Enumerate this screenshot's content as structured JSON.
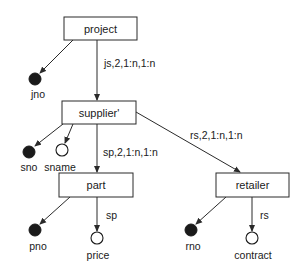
{
  "diagram": {
    "type": "object-hierarchy-schema",
    "nodes": [
      {
        "id": "project",
        "label": "project"
      },
      {
        "id": "supplier",
        "label": "supplier'"
      },
      {
        "id": "part",
        "label": "part"
      },
      {
        "id": "retailer",
        "label": "retailer"
      }
    ],
    "relationships": [
      {
        "from": "project",
        "to": "supplier",
        "label": "js,2,1:n,1:n"
      },
      {
        "from": "supplier",
        "to": "part",
        "label": "sp,2,1:n,1:n"
      },
      {
        "from": "supplier",
        "to": "retailer",
        "label": "rs,2,1:n,1:n"
      }
    ],
    "attributes": [
      {
        "owner": "project",
        "label": "jno",
        "key": true,
        "edge_label": ""
      },
      {
        "owner": "supplier",
        "label": "sno",
        "key": true,
        "edge_label": ""
      },
      {
        "owner": "supplier",
        "label": "sname",
        "key": false,
        "edge_label": ""
      },
      {
        "owner": "part",
        "label": "pno",
        "key": true,
        "edge_label": ""
      },
      {
        "owner": "part",
        "label": "price",
        "key": false,
        "edge_label": "sp"
      },
      {
        "owner": "retailer",
        "label": "rno",
        "key": true,
        "edge_label": ""
      },
      {
        "owner": "retailer",
        "label": "contract",
        "key": false,
        "edge_label": "rs"
      }
    ],
    "legend_semantics": {
      "filled_circle": "key attribute",
      "hollow_circle": "non-key attribute"
    }
  }
}
